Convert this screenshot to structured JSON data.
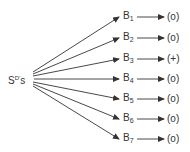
{
  "source": {
    "label": "S",
    "superscript": "D'",
    "suffix": "s"
  },
  "colors": {
    "ink": "#333333",
    "background": "#ffffff"
  },
  "targets": [
    {
      "label": "B",
      "subscript": "1",
      "outcome": "(o)"
    },
    {
      "label": "B",
      "subscript": "2",
      "outcome": "(o)"
    },
    {
      "label": "B",
      "subscript": "3",
      "outcome": "(+)"
    },
    {
      "label": "B",
      "subscript": "4",
      "outcome": "(o)"
    },
    {
      "label": "B",
      "subscript": "5",
      "outcome": "(o)"
    },
    {
      "label": "B",
      "subscript": "6",
      "outcome": "(o)"
    },
    {
      "label": "B",
      "subscript": "7",
      "outcome": "(o)"
    }
  ]
}
